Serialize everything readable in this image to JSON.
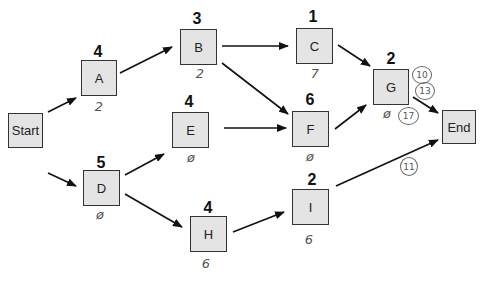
{
  "nodes": {
    "start": {
      "label": "Start"
    },
    "a": {
      "label": "A",
      "duration": "4",
      "note": "2"
    },
    "b": {
      "label": "B",
      "duration": "3",
      "note": "2"
    },
    "c": {
      "label": "C",
      "duration": "1",
      "note": "7"
    },
    "d": {
      "label": "D",
      "duration": "5",
      "note": "ø"
    },
    "e": {
      "label": "E",
      "duration": "4",
      "note": "ø"
    },
    "f": {
      "label": "F",
      "duration": "6",
      "note": "ø"
    },
    "g": {
      "label": "G",
      "duration": "2",
      "note": "ø"
    },
    "h": {
      "label": "H",
      "duration": "4",
      "note": "6"
    },
    "i": {
      "label": "I",
      "duration": "2",
      "note": "6"
    },
    "end": {
      "label": "End"
    }
  },
  "annotations": {
    "g_circled_1": "10",
    "g_circled_2": "13",
    "g_circled_3": "17",
    "i_end_circled": "11"
  },
  "edges": [
    [
      "Start",
      "A"
    ],
    [
      "Start",
      "D"
    ],
    [
      "A",
      "B"
    ],
    [
      "B",
      "C"
    ],
    [
      "B",
      "F"
    ],
    [
      "C",
      "G"
    ],
    [
      "D",
      "E"
    ],
    [
      "D",
      "H"
    ],
    [
      "E",
      "F"
    ],
    [
      "F",
      "G"
    ],
    [
      "G",
      "End"
    ],
    [
      "H",
      "I"
    ],
    [
      "I",
      "End"
    ]
  ]
}
